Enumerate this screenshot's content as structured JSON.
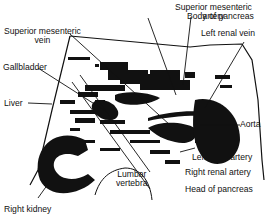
{
  "diagram": {
    "type": "anatomical cross-section (transverse ultrasound schematic)",
    "labels": {
      "superior_mesenteric_artery_l1": "Superior mesenteric",
      "superior_mesenteric_artery_l2": "artery",
      "body_of_pancreas": "Body of pancreas",
      "superior_mesenteric_vein_l1": "Superior mesenteric",
      "superior_mesenteric_vein_l2": "vein",
      "left_renal_vein": "Left renal vein",
      "gallbladder": "Gallbladder",
      "liver": "Liver",
      "aorta": "Aorta",
      "left_renal_artery": "Left renal artery",
      "lumbar_vertebra_l1": "Lumbar",
      "lumbar_vertebra_l2": "vertebra",
      "right_renal_artery": "Right renal artery",
      "head_of_pancreas": "Head of pancreas",
      "right_kidney": "Right kidney"
    },
    "colors": {
      "ink": "#111111",
      "background": "#ffffff"
    }
  }
}
